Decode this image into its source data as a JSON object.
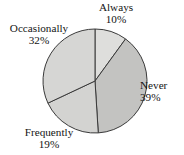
{
  "chart_data": {
    "type": "pie",
    "title": "",
    "subtitle": "",
    "xlabel": "",
    "ylabel": "",
    "legend_position": "none",
    "grid": false,
    "labels_outside": true,
    "start_angle_deg": 0,
    "direction": "clockwise",
    "center": {
      "x": 95,
      "y": 81
    },
    "radius": 52,
    "categories": [
      "Always",
      "Never",
      "Frequently",
      "Occasionally"
    ],
    "values": [
      10,
      39,
      19,
      32
    ],
    "units": "%",
    "slices": [
      {
        "name": "Always",
        "value": 10,
        "percent_text": "10%",
        "angle_deg": 36,
        "start_deg": 0,
        "end_deg": 36,
        "color": "#dededc",
        "label_name": "Always",
        "label_value": "10%"
      },
      {
        "name": "Never",
        "value": 39,
        "percent_text": "39%",
        "angle_deg": 140.4,
        "start_deg": 36,
        "end_deg": 176.4,
        "color": "#c3c3c1",
        "label_name": "Never",
        "label_value": "39%"
      },
      {
        "name": "Frequently",
        "value": 19,
        "percent_text": "19%",
        "angle_deg": 68.4,
        "start_deg": 176.4,
        "end_deg": 244.8,
        "color": "#d3d3d1",
        "label_name": "Frequently",
        "label_value": "19%"
      },
      {
        "name": "Occasionally",
        "value": 32,
        "percent_text": "32%",
        "angle_deg": 115.2,
        "start_deg": 244.8,
        "end_deg": 360,
        "color": "#d6d6d4",
        "label_name": "Occasionally",
        "label_value": "32%"
      }
    ],
    "stroke_color": "#3a3a3a",
    "stroke_width": 1,
    "background": "#ffffff"
  }
}
